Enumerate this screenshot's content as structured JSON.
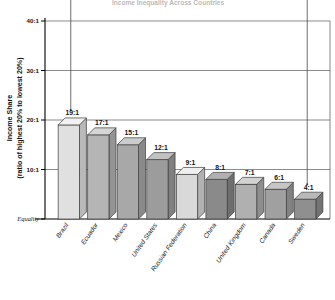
{
  "chart_data": {
    "type": "bar",
    "title": "Income Inequality Across Countries",
    "xlabel": "",
    "ylabel": "Income Share",
    "ylabel_line2": "(ratio of highest 20% to lowest 20%)",
    "categories": [
      "Brazil",
      "Ecuador",
      "Mexico",
      "United States",
      "Russian Federation",
      "China",
      "United Kingdom",
      "Canada",
      "Sweden"
    ],
    "values": [
      19,
      17,
      15,
      12,
      9,
      8,
      7,
      6,
      4
    ],
    "data_labels": [
      "19:1",
      "17:1",
      "15:1",
      "12:1",
      "9:1",
      "8:1",
      "7:1",
      "6:1",
      "4:1"
    ],
    "ylim": [
      0,
      40
    ],
    "ytick_values": [
      40,
      30,
      20,
      10,
      0
    ],
    "ytick_labels": [
      "40:1",
      "30:1",
      "20:1",
      "10:1",
      "Equality"
    ],
    "grid": true,
    "legend": "none",
    "bar_face_colors": [
      "#e0e0e0",
      "#b5b5b5",
      "#a8a8a8",
      "#9c9c9c",
      "#d9d9d9",
      "#8a8a8a",
      "#b0b0b0",
      "#a0a0a0",
      "#8f8f8f"
    ],
    "bar_top_colors": [
      "#f2f2f2",
      "#d6d6d6",
      "#cccccc",
      "#c2c2c2",
      "#efefef",
      "#b0b0b0",
      "#d2d2d2",
      "#c6c6c6",
      "#b8b8b8"
    ],
    "bar_side_colors": [
      "#b9b9b9",
      "#949494",
      "#8a8a8a",
      "#808080",
      "#b2b2b2",
      "#6e6e6e",
      "#8e8e8e",
      "#828282",
      "#737373"
    ],
    "annotations": [
      {
        "label": "pointer-to-brazil",
        "target_category": "Brazil"
      },
      {
        "label": "pointer-to-sweden",
        "target_category": "Sweden"
      }
    ],
    "colors": {
      "grid": "#5a5a5a",
      "axis": "#000000",
      "text": "#111111",
      "background": "#ffffff"
    }
  }
}
